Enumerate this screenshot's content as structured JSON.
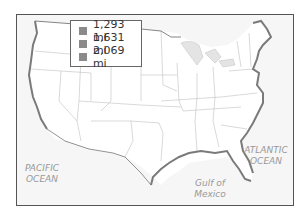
{
  "map": {
    "title": "United States coastline map",
    "legend": {
      "items": [
        {
          "label": "1,293 mi",
          "color": "#8a8a8a"
        },
        {
          "label": "1,631 mi",
          "color": "#8a8a8a"
        },
        {
          "label": "2,069 mi",
          "color": "#8a8a8a"
        }
      ]
    },
    "labels": {
      "pacific_line1": "PACIFIC",
      "pacific_line2": "OCEAN",
      "atlantic_line1": "ATLANTIC",
      "atlantic_line2": "OCEAN",
      "gulf_line1": "Gulf of",
      "gulf_line2": "Mexico"
    },
    "colors": {
      "land": "#ffffff",
      "water": "#f2f2f2",
      "coast_highlight": "#7a7a7a",
      "state_border": "#bbbbbb",
      "lakes": "#e4e4e4"
    }
  }
}
